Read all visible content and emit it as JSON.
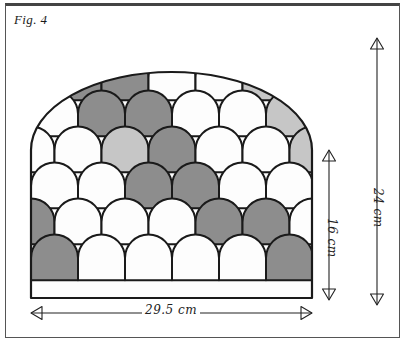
{
  "figure": {
    "caption": "Fig. 4"
  },
  "frame": {
    "border_color": "#555555",
    "top_border_color": "#444444",
    "background": "#ffffff"
  },
  "shape": {
    "name": "arched-scallop-panel",
    "outline_color": "#1a1a1a",
    "left_px": 31,
    "right_px": 312,
    "top_px": 72,
    "bottom_px": 298,
    "arch_spring_px": 150
  },
  "palette": {
    "white": "#fdfdfd",
    "mid_gray": "#8d8d8d",
    "light_gray": "#c6c6c6",
    "outline": "#1a1a1a",
    "ink": "#222222"
  },
  "dimensions": [
    {
      "id": "height-inner",
      "label": "16 cm",
      "value": 16,
      "unit": "cm",
      "orientation": "vertical",
      "arrow_heads": "both",
      "x_px": 329,
      "y_from_px": 150,
      "y_to_px": 300
    },
    {
      "id": "height-total",
      "label": "24 cm",
      "value": 24,
      "unit": "cm",
      "orientation": "vertical",
      "arrow_heads": "both",
      "x_px": 377,
      "y_from_px": 38,
      "y_to_px": 305
    },
    {
      "id": "width-total",
      "label": "29.5 cm",
      "value": 29.5,
      "unit": "cm",
      "orientation": "horizontal",
      "arrow_heads": "both",
      "y_px": 313,
      "x_from_px": 31,
      "x_to_px": 312
    }
  ],
  "scale_pattern": {
    "type": "scallop-rows",
    "scale_width_px": 47,
    "row_pitch_px": 36,
    "rows": [
      {
        "index": 0,
        "y_px": 78,
        "offset": 0.5,
        "colors": [
          "white",
          "mid_gray",
          "mid_gray",
          "white",
          "white",
          "light_gray",
          "light_gray"
        ]
      },
      {
        "index": 1,
        "y_px": 114,
        "offset": 0.0,
        "colors": [
          "white",
          "white",
          "mid_gray",
          "mid_gray",
          "white",
          "white",
          "light_gray",
          "light_gray"
        ]
      },
      {
        "index": 2,
        "y_px": 150,
        "offset": 0.5,
        "colors": [
          "white",
          "white",
          "light_gray",
          "mid_gray",
          "white",
          "white",
          "light_gray",
          "light_gray"
        ]
      },
      {
        "index": 3,
        "y_px": 186,
        "offset": 0.0,
        "colors": [
          "white",
          "white",
          "white",
          "mid_gray",
          "mid_gray",
          "white",
          "white",
          "mid_gray"
        ]
      },
      {
        "index": 4,
        "y_px": 222,
        "offset": 0.5,
        "colors": [
          "mid_gray",
          "white",
          "white",
          "white",
          "mid_gray",
          "mid_gray",
          "white",
          "white"
        ]
      },
      {
        "index": 5,
        "y_px": 258,
        "offset": 0.0,
        "colors": [
          "mid_gray",
          "mid_gray",
          "white",
          "white",
          "white",
          "white",
          "mid_gray",
          "mid_gray"
        ]
      }
    ]
  }
}
